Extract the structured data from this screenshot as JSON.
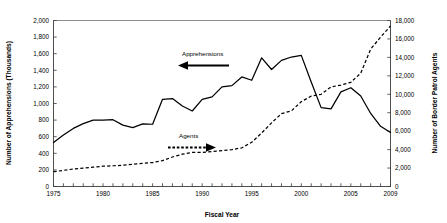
{
  "chart_data": {
    "type": "line",
    "title": "",
    "xlabel": "Fiscal Year",
    "ylabel": "Number of Apprehensions (Thousands)",
    "y2label": "Number of Border Patrol Agents",
    "grid": false,
    "legend_position": "inline-annotations",
    "xlim": [
      1975,
      2009
    ],
    "ylim": [
      0,
      2000
    ],
    "y2lim": [
      0,
      18000
    ],
    "x_tick_step": 1,
    "x_labeled_ticks": [
      1975,
      1980,
      1985,
      1990,
      1995,
      2000,
      2005,
      2009
    ],
    "x_tick_labels": [
      "1975",
      "1980",
      "1985",
      "1990",
      "1995",
      "2000",
      "2005",
      "2009"
    ],
    "y_ticks": [
      0,
      200,
      400,
      600,
      800,
      1000,
      1200,
      1400,
      1600,
      1800,
      2000
    ],
    "y_tick_labels": [
      "0",
      "200",
      "400",
      "600",
      "800",
      "1,000",
      "1,200",
      "1,400",
      "1,600",
      "1,800",
      "2,000"
    ],
    "y2_ticks": [
      0,
      2000,
      4000,
      6000,
      8000,
      10000,
      12000,
      14000,
      16000,
      18000
    ],
    "y2_tick_labels": [
      "0",
      "2,000",
      "4,000",
      "6,000",
      "8,000",
      "10,000",
      "12,000",
      "14,000",
      "16,000",
      "18,000"
    ],
    "x": [
      1975,
      1976,
      1977,
      1978,
      1979,
      1980,
      1981,
      1982,
      1983,
      1984,
      1985,
      1986,
      1987,
      1988,
      1989,
      1990,
      1991,
      1992,
      1993,
      1994,
      1995,
      1996,
      1997,
      1998,
      1999,
      2000,
      2001,
      2002,
      2003,
      2004,
      2005,
      2006,
      2007,
      2008,
      2009
    ],
    "series": [
      {
        "name": "Apprehensions",
        "axis": "left",
        "style": "solid",
        "units": "thousands",
        "values": [
          530,
          620,
          700,
          757,
          800,
          800,
          805,
          740,
          710,
          755,
          750,
          1050,
          1060,
          970,
          910,
          1050,
          1080,
          1200,
          1215,
          1320,
          1280,
          1550,
          1410,
          1520,
          1560,
          1580,
          1260,
          950,
          935,
          1140,
          1190,
          1090,
          880,
          725,
          650
        ]
      },
      {
        "name": "Agents",
        "axis": "right",
        "style": "dashed",
        "units": "agents",
        "values": [
          1600,
          1750,
          1900,
          2000,
          2100,
          2200,
          2250,
          2300,
          2400,
          2500,
          2600,
          2800,
          3200,
          3500,
          3700,
          3700,
          3800,
          3900,
          4000,
          4200,
          4800,
          5800,
          6900,
          7900,
          8200,
          9200,
          9800,
          10000,
          10800,
          11000,
          11300,
          12300,
          14900,
          16200,
          17400
        ]
      }
    ],
    "annotations": [
      {
        "label": "Apprehensions",
        "arrow": "left",
        "arrow_style": "solid",
        "target_series": "Apprehensions"
      },
      {
        "label": "Agents",
        "arrow": "right",
        "arrow_style": "dashed",
        "target_series": "Agents"
      }
    ]
  }
}
